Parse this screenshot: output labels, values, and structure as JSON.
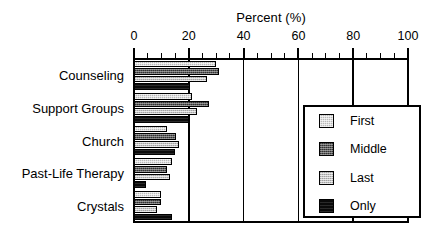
{
  "chart_data": {
    "type": "bar",
    "orientation": "horizontal",
    "title": "Percent (%)",
    "xlabel": "Percent (%)",
    "ylabel": "",
    "xlim": [
      0,
      100
    ],
    "xticks": [
      0,
      20,
      40,
      60,
      80,
      100
    ],
    "xtick_labels": [
      "0",
      "20",
      "40",
      "60",
      "80",
      "100"
    ],
    "minor_tick_step": 5,
    "grid": "vertical gridlines at 20, 40, 60, 80",
    "legend_position": "lower right, inside plot area",
    "categories": [
      "Counseling",
      "Support Groups",
      "Church",
      "Past-Life Therapy",
      "Crystals"
    ],
    "series": [
      {
        "name": "First",
        "color": "#b9b9b9",
        "values": [
          30.0,
          21.0,
          12.0,
          14.0,
          10.0
        ]
      },
      {
        "name": "Middle",
        "color": "#5a5a5a",
        "values": [
          31.0,
          27.5,
          15.5,
          12.0,
          10.0
        ]
      },
      {
        "name": "Last",
        "color": "#c4c4c4",
        "values": [
          26.5,
          23.0,
          16.5,
          13.0,
          8.5
        ]
      },
      {
        "name": "Only",
        "color": "#0a0a0a",
        "values": [
          20.5,
          20.0,
          15.0,
          4.5,
          14.0
        ]
      }
    ]
  },
  "legend": {
    "items": [
      {
        "label": "First"
      },
      {
        "label": "Middle"
      },
      {
        "label": "Last"
      },
      {
        "label": "Only"
      }
    ]
  }
}
